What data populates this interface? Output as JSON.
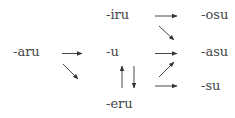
{
  "diagram": {
    "nodes": {
      "aru": "-aru",
      "iru": "-iru",
      "u": "-u",
      "eru": "-eru",
      "osu": "-osu",
      "asu": "-asu",
      "su": "-su"
    },
    "edges": [
      {
        "from": "-aru",
        "to": "-u",
        "direction": "right"
      },
      {
        "from": "-aru",
        "to": "-eru",
        "direction": "down-right"
      },
      {
        "from": "-iru",
        "to": "-osu",
        "direction": "right"
      },
      {
        "from": "-iru",
        "to": "-asu",
        "direction": "down-right"
      },
      {
        "from": "-u",
        "to": "-asu",
        "direction": "right"
      },
      {
        "from": "-eru",
        "to": "-u",
        "direction": "up"
      },
      {
        "from": "-u",
        "to": "-eru",
        "direction": "down"
      },
      {
        "from": "-eru",
        "to": "-asu",
        "direction": "up-right"
      },
      {
        "from": "-eru",
        "to": "-su",
        "direction": "right"
      }
    ],
    "colors": {
      "text": "#444444",
      "arrow": "#333333",
      "background": "#ffffff"
    }
  }
}
